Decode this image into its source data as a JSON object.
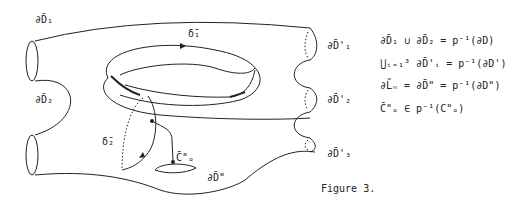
{
  "figure": {
    "caption": "Figure 3.",
    "labels": {
      "dD1": "∂D̄₁",
      "dD2": "∂D̄₂",
      "delta1": "δ̄₁",
      "delta2": "δ̄₂",
      "C_o": "C̄\"ₒ",
      "dDpp": "∂D̄\"",
      "dDp1": "∂D̄'₁",
      "dDp2": "∂D̄'₂",
      "dDp3": "∂D̄'₃"
    },
    "equations": [
      "∂D̄₁ ∪ ∂D̄₂ = p⁻¹(∂D)",
      "⋃ᵢ₌₁³ ∂D̄'ᵢ = p⁻¹(∂D')",
      "∂L̃ₙ = ∂D̄\" = p⁻¹(∂D\")",
      "C̄\"ₒ ∈ p⁻¹(C\"ₒ)"
    ],
    "colors": {
      "line": "#222222",
      "background": "#ffffff"
    }
  }
}
